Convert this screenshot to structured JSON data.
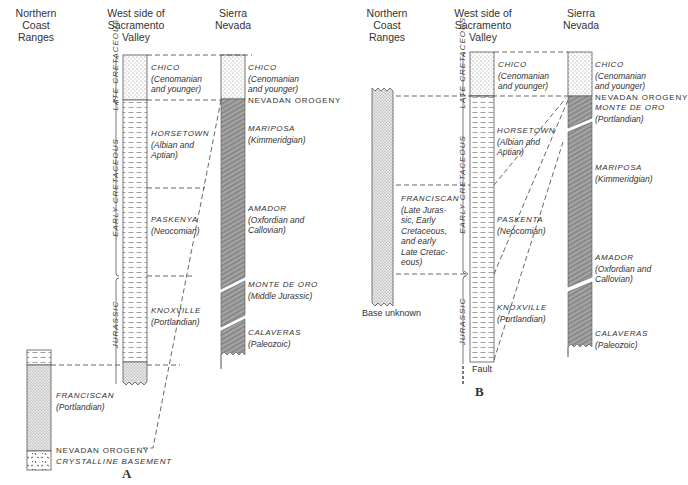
{
  "figures": {
    "A": {
      "label": "A",
      "headers": {
        "coast": "Northern\nCoast\nRanges",
        "valley": "West side of\nSacramento\nValley",
        "sierra": "Sierra\nNevada"
      },
      "periods": [
        "LATE CRETACEOUS",
        "EARLY CRETACEOUS",
        "JURASSIC"
      ],
      "valley_units": [
        {
          "name": "CHICO",
          "age": "(Cenomanian",
          "age2": "and younger)"
        },
        {
          "name": "HORSETOWN",
          "age": "(Albian and",
          "age2": "Aptian)"
        },
        {
          "name": "PASKENYA",
          "age": "(Neocomian)"
        },
        {
          "name": "KNOXVILLE",
          "age": "(Portlandian)"
        }
      ],
      "sierra_units": [
        {
          "name": "CHICO",
          "age": "(Cenomanian",
          "age2": "and younger)"
        },
        {
          "name": "NEVADAN OROGENY"
        },
        {
          "name": "MARIPOSA",
          "age": "(Kimmeridgian)"
        },
        {
          "name": "AMADOR",
          "age": "(Oxfordian and",
          "age2": "Callovian)"
        },
        {
          "name": "MONTE DE ORO",
          "age": "(Middle Jurassic)"
        },
        {
          "name": "CALAVERAS",
          "age": "(Paleozoic)"
        }
      ],
      "coast_units": [
        {
          "name": "FRANCISCAN",
          "age": "(Portlandian)"
        }
      ],
      "bottom_captions": [
        "NEVADAN OROGENY",
        "CRYSTALLINE BASEMENT"
      ]
    },
    "B": {
      "label": "B",
      "headers": {
        "coast": "Northern\nCoast\nRanges",
        "valley": "West side of\nSacramento\nValley",
        "sierra": "Sierra\nNevada"
      },
      "periods": [
        "LATE CRETACEOUS",
        "EARLY CRETACEOUS",
        "JURASSIC"
      ],
      "valley_units": [
        {
          "name": "CHICO",
          "age": "(Cenomanian",
          "age2": "and younger)"
        },
        {
          "name": "HORSETOWN",
          "age": "(Albian and",
          "age2": "Aptian)"
        },
        {
          "name": "PASKENTA",
          "age": "(Neocomian)"
        },
        {
          "name": "KNOXVILLE",
          "age": "(Portlandian)"
        }
      ],
      "sierra_units": [
        {
          "name": "CHICO",
          "age": "(Cenomanian",
          "age2": "and younger)"
        },
        {
          "name": "NEVADAN OROGENY"
        },
        {
          "name": "MONTE DE ORO",
          "age": "(Portlandian)"
        },
        {
          "name": "MARIPOSA",
          "age": "(Kimmeridgian)"
        },
        {
          "name": "AMADOR",
          "age": "(Oxfordian and",
          "age2": "Callovian)"
        },
        {
          "name": "CALAVERAS",
          "age": "(Paleozoic)"
        }
      ],
      "coast_units": [
        {
          "name": "FRANCISCAN",
          "lines": [
            "(Late Juras-",
            "sic, Early",
            "Cretaceous,",
            "and early",
            "Late Cretac-",
            "eous)"
          ]
        }
      ],
      "captions": {
        "base": "Base unknown",
        "fault": "Fault"
      }
    }
  }
}
